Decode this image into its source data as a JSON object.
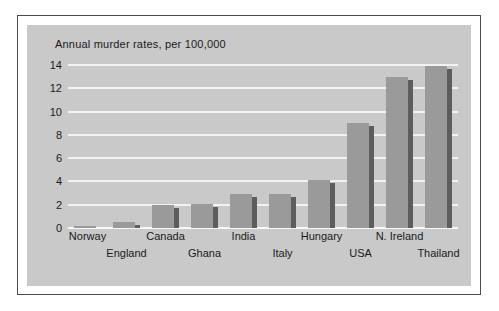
{
  "chart_data": {
    "type": "bar",
    "title": "Annual murder rates, per 100,000",
    "xlabel": "",
    "ylabel": "",
    "ylim": [
      0,
      14
    ],
    "ytick_labels": [
      "0",
      "2",
      "4",
      "6",
      "8",
      "10",
      "12",
      "14"
    ],
    "yticks": [
      0,
      2,
      4,
      6,
      8,
      10,
      12,
      14
    ],
    "grid": true,
    "legend": "none",
    "style": "3d-bar",
    "categories": [
      "Norway",
      "England",
      "Canada",
      "Ghana",
      "India",
      "Italy",
      "Hungary",
      "USA",
      "N. Ireland",
      "Thailand"
    ],
    "values": [
      0.2,
      0.5,
      2.0,
      2.1,
      2.9,
      2.9,
      4.1,
      9.0,
      13.0,
      13.9
    ],
    "label_rows": [
      "top",
      "bottom",
      "top",
      "bottom",
      "top",
      "bottom",
      "top",
      "bottom",
      "top",
      "bottom"
    ],
    "colors": {
      "bar_front": "#9a9a9a",
      "bar_side": "#5d5d5d",
      "plot_background": "#c9c9c9",
      "gridline": "#f2f2f2",
      "text": "#1a1a1a",
      "frame_border": "#4a4a4a",
      "page_background": "#ffffff"
    }
  }
}
